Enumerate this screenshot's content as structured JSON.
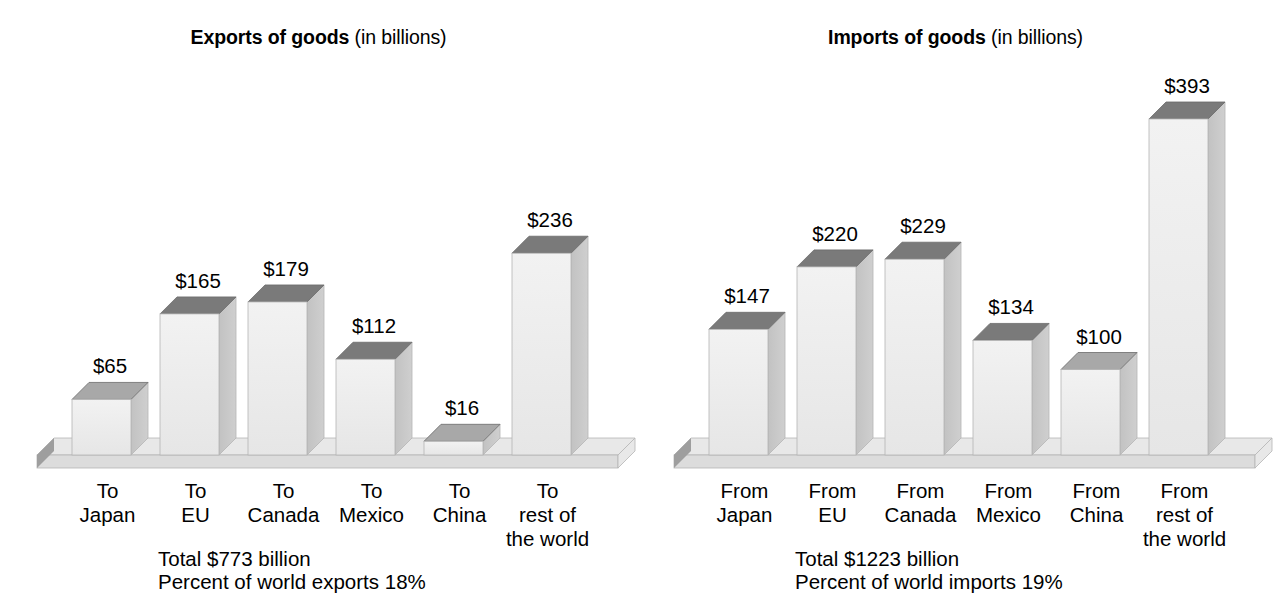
{
  "panels": [
    {
      "id": "exports",
      "title_strong": "Exports of goods",
      "title_light": "(in billions)",
      "footer": {
        "total_label": "Total",
        "total_value": "$773 billion",
        "percent_label": "Percent of world exports",
        "percent_value": "18%"
      },
      "bars": [
        {
          "label_line1": "To",
          "label_line2": "Japan",
          "label_line3": "",
          "value": 65,
          "value_label": "$65"
        },
        {
          "label_line1": "To",
          "label_line2": "EU",
          "label_line3": "",
          "value": 165,
          "value_label": "$165"
        },
        {
          "label_line1": "To",
          "label_line2": "Canada",
          "label_line3": "",
          "value": 179,
          "value_label": "$179"
        },
        {
          "label_line1": "To",
          "label_line2": "Mexico",
          "label_line3": "",
          "value": 112,
          "value_label": "$112"
        },
        {
          "label_line1": "To",
          "label_line2": "China",
          "label_line3": "",
          "value": 16,
          "value_label": "$16"
        },
        {
          "label_line1": "To",
          "label_line2": "rest of",
          "label_line3": "the world",
          "value": 236,
          "value_label": "$236"
        }
      ]
    },
    {
      "id": "imports",
      "title_strong": "Imports of goods",
      "title_light": "(in billions)",
      "footer": {
        "total_label": "Total",
        "total_value": "$1223 billion",
        "percent_label": "Percent of world imports",
        "percent_value": "19%"
      },
      "bars": [
        {
          "label_line1": "From",
          "label_line2": "Japan",
          "label_line3": "",
          "value": 147,
          "value_label": "$147"
        },
        {
          "label_line1": "From",
          "label_line2": "EU",
          "label_line3": "",
          "value": 220,
          "value_label": "$220"
        },
        {
          "label_line1": "From",
          "label_line2": "Canada",
          "label_line3": "",
          "value": 229,
          "value_label": "$229"
        },
        {
          "label_line1": "From",
          "label_line2": "Mexico",
          "label_line3": "",
          "value": 134,
          "value_label": "$134"
        },
        {
          "label_line1": "From",
          "label_line2": "China",
          "label_line3": "",
          "value": 100,
          "value_label": "$100"
        },
        {
          "label_line1": "From",
          "label_line2": "rest of",
          "label_line3": "the world",
          "value": 393,
          "value_label": "$393"
        }
      ]
    }
  ],
  "colors": {
    "front_top": "#f2f2f2",
    "front_bottom": "#e6e6e6",
    "top_dark": "#7a7a7a",
    "top_light": "#a8a8a8",
    "side_dark": "#c2c2c2",
    "side_light": "#cfcfcf",
    "floor_top": "#e8e8e8",
    "floor_front": "#dcdcdc",
    "floor_cap": "#9e9e9e",
    "outline": "#b5b5b5",
    "text": "#000000"
  },
  "chart_data": {
    "type": "bar",
    "xlabel": "",
    "ylabel": "Billions of dollars",
    "grid": false,
    "legend": "none",
    "ylim": [
      0,
      393
    ],
    "panels": [
      {
        "title": "Exports of goods (in billions)",
        "categories": [
          "To Japan",
          "To EU",
          "To Canada",
          "To Mexico",
          "To China",
          "To rest of the world"
        ],
        "values": [
          65,
          165,
          179,
          112,
          16,
          236
        ],
        "data_labels": [
          "$65",
          "$165",
          "$179",
          "$112",
          "$16",
          "$236"
        ],
        "total": 773,
        "total_text": "Total  $773 billion",
        "percent_of_world": 18,
        "percent_text": "Percent of world exports   18%"
      },
      {
        "title": "Imports of goods (in billions)",
        "categories": [
          "From Japan",
          "From EU",
          "From Canada",
          "From Mexico",
          "From China",
          "From rest of the world"
        ],
        "values": [
          147,
          220,
          229,
          134,
          100,
          393
        ],
        "data_labels": [
          "$147",
          "$220",
          "$229",
          "$134",
          "$100",
          "$393"
        ],
        "total": 1223,
        "total_text": "Total  $1223 billion",
        "percent_of_world": 19,
        "percent_text": "Percent of world imports  19%"
      }
    ]
  }
}
